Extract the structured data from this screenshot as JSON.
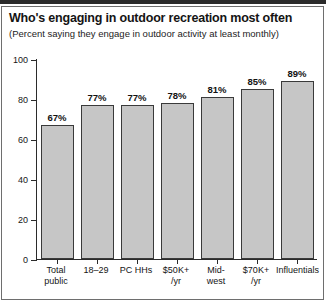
{
  "chart_data": {
    "type": "bar",
    "title": "Who's engaging in outdoor recreation most often",
    "subtitle": "(Percent saying they engage in outdoor activity at least monthly)",
    "xlabel": "",
    "ylabel": "",
    "ylim": [
      0,
      100
    ],
    "yticks": [
      0,
      20,
      40,
      60,
      80,
      100
    ],
    "ytick_labels": [
      "0",
      "20",
      "40",
      "60",
      "80",
      "100"
    ],
    "grid": false,
    "legend": null,
    "categories": [
      "Total public",
      "18–29",
      "PC HHs",
      "$50K+ /yr",
      "Mid-west",
      "$70K+ /yr",
      "Influentials"
    ],
    "category_lines": [
      [
        "Total",
        "public"
      ],
      [
        "18–29",
        ""
      ],
      [
        "PC HHs",
        ""
      ],
      [
        "$50K+",
        "/yr"
      ],
      [
        "Mid-",
        "west"
      ],
      [
        "$70K+",
        "/yr"
      ],
      [
        "Influentials",
        ""
      ]
    ],
    "values": [
      67,
      77,
      77,
      78,
      81,
      85,
      89
    ],
    "value_labels": [
      "67%",
      "77%",
      "77%",
      "78%",
      "81%",
      "85%",
      "89%"
    ],
    "bar_color": "#c6c6c6",
    "bar_edge_color": "#3a3a3a",
    "axis_color": "#2b2b2b"
  },
  "footer": {
    "source_note": ""
  }
}
